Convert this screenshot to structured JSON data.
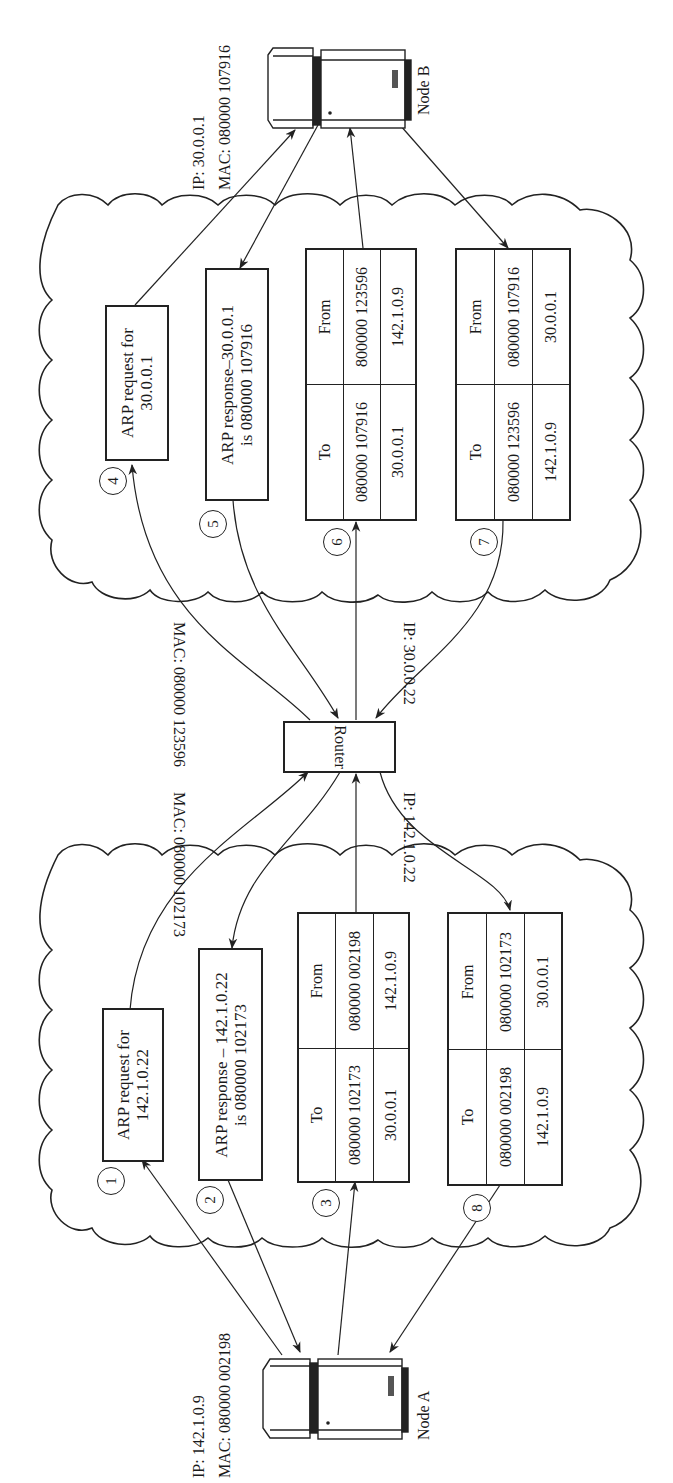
{
  "diagram": {
    "orientation": "rotated 90 degrees counter-clockwise",
    "node_a": {
      "name": "Node A",
      "ip_label": "IP: 142.1.0.9",
      "mac_label": "MAC: 080000 002198"
    },
    "node_b": {
      "name": "Node B",
      "ip_label": "IP: 30.0.0.1",
      "mac_label": "MAC: 080000 107916"
    },
    "router": {
      "name": "Router",
      "left_ip_label": "IP: 142.1.0.22",
      "left_mac_label": "MAC: 080000 102173",
      "right_ip_label": "IP: 30.0.0.22",
      "right_mac_label": "MAC: 080000 123596"
    },
    "network_a": {
      "steps": [
        {
          "number": "1",
          "type": "arp",
          "line1": "ARP request for",
          "line2": "142.1.0.22"
        },
        {
          "number": "2",
          "type": "arp",
          "line1": "ARP response – 142.1.0.22",
          "line2": "is 080000 102173"
        },
        {
          "number": "3",
          "type": "frame",
          "to_header": "To",
          "from_header": "From",
          "to_mac": "080000 102173",
          "from_mac": "080000 002198",
          "to_ip": "30.0.0.1",
          "from_ip": "142.1.0.9"
        },
        {
          "number": "8",
          "type": "frame",
          "to_header": "To",
          "from_header": "From",
          "to_mac": "080000 002198",
          "from_mac": "080000 102173",
          "to_ip": "142.1.0.9",
          "from_ip": "30.0.0.1"
        }
      ]
    },
    "network_b": {
      "steps": [
        {
          "number": "4",
          "type": "arp",
          "line1": "ARP request for",
          "line2": "30.0.0.1"
        },
        {
          "number": "5",
          "type": "arp",
          "line1": "ARP response–30.0.0.1",
          "line2": "is 080000 107916"
        },
        {
          "number": "6",
          "type": "frame",
          "to_header": "To",
          "from_header": "From",
          "to_mac": "080000 107916",
          "from_mac": "800000 123596",
          "to_ip": "30.0.0.1",
          "from_ip": "142.1.0.9"
        },
        {
          "number": "7",
          "type": "frame",
          "to_header": "To",
          "from_header": "From",
          "to_mac": "080000 123596",
          "from_mac": "080000 107916",
          "to_ip": "142.1.0.9",
          "from_ip": "30.0.0.1"
        }
      ]
    }
  }
}
